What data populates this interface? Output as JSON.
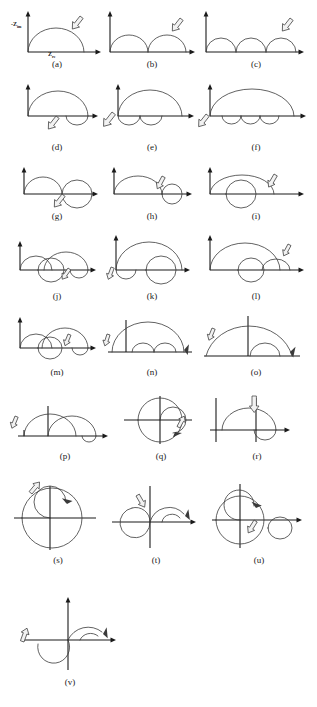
{
  "figure": {
    "axis_labels": {
      "y_main": "-Z",
      "y_sub": "im",
      "x_main": "Z",
      "x_sub": "re"
    },
    "panels": [
      {
        "id": "a",
        "label": "(a)",
        "description": "single depressed semicircle above real axis",
        "x": 10,
        "y": 6,
        "w": 94,
        "h": 50,
        "label_x": 10,
        "label_y": 60,
        "label_w": 94
      },
      {
        "id": "b",
        "label": "(b)",
        "description": "two adjacent semicircles above real axis",
        "x": 104,
        "y": 6,
        "w": 96,
        "h": 50,
        "label_x": 104,
        "label_y": 60,
        "label_w": 96
      },
      {
        "id": "c",
        "label": "(c)",
        "description": "three adjacent semicircles above real axis",
        "x": 200,
        "y": 6,
        "w": 112,
        "h": 50,
        "label_x": 200,
        "label_y": 60,
        "label_w": 112
      },
      {
        "id": "d",
        "label": "(d)",
        "description": "large semicircle above plus one inductive loop below",
        "x": 10,
        "y": 82,
        "w": 94,
        "h": 56,
        "label_x": 10,
        "label_y": 143,
        "label_w": 94
      },
      {
        "id": "e",
        "label": "(e)",
        "description": "large semicircle above plus two inductive loops below",
        "x": 104,
        "y": 82,
        "w": 96,
        "h": 56,
        "label_x": 104,
        "label_y": 143,
        "label_w": 96
      },
      {
        "id": "f",
        "label": "(f)",
        "description": "large semicircle above plus three inductive loops below",
        "x": 200,
        "y": 82,
        "w": 112,
        "h": 56,
        "label_x": 200,
        "label_y": 143,
        "label_w": 112
      },
      {
        "id": "g",
        "label": "(g)",
        "description": "semicircle then larger loop crossing below axis",
        "x": 10,
        "y": 166,
        "w": 94,
        "h": 44,
        "label_x": 10,
        "label_y": 212,
        "label_w": 94
      },
      {
        "id": "h",
        "label": "(h)",
        "description": "semicircle plus small circle straddling axis",
        "x": 104,
        "y": 166,
        "w": 96,
        "h": 44,
        "label_x": 104,
        "label_y": 212,
        "label_w": 96
      },
      {
        "id": "i",
        "label": "(i)",
        "description": "semicircle overlapping a full circle below axis",
        "x": 200,
        "y": 166,
        "w": 112,
        "h": 44,
        "label_x": 200,
        "label_y": 212,
        "label_w": 112
      },
      {
        "id": "j",
        "label": "(j)",
        "description": "small semicircle, overlapping circle and larger loop",
        "x": 10,
        "y": 232,
        "w": 94,
        "h": 56,
        "label_x": 10,
        "label_y": 292,
        "label_w": 94
      },
      {
        "id": "k",
        "label": "(k)",
        "description": "large semicircle with nested circle and small loop",
        "x": 104,
        "y": 232,
        "w": 96,
        "h": 56,
        "label_x": 104,
        "label_y": 292,
        "label_w": 96
      },
      {
        "id": "l",
        "label": "(l)",
        "description": "large semicircle with circle below and small arc right",
        "x": 200,
        "y": 232,
        "w": 112,
        "h": 56,
        "label_x": 200,
        "label_y": 292,
        "label_w": 112
      },
      {
        "id": "m",
        "label": "(m)",
        "description": "semicircle, circle crossing axis and small loop",
        "x": 10,
        "y": 312,
        "w": 94,
        "h": 52,
        "label_x": 10,
        "label_y": 368,
        "label_w": 94
      },
      {
        "id": "n",
        "label": "(n)",
        "description": "large arc with two small semicircles, axis offset right",
        "x": 104,
        "y": 312,
        "w": 96,
        "h": 52,
        "label_x": 104,
        "label_y": 368,
        "label_w": 96
      },
      {
        "id": "o",
        "label": "(o)",
        "description": "large arc crossing vertical axis plus small arc",
        "x": 200,
        "y": 312,
        "w": 112,
        "h": 52,
        "label_x": 200,
        "label_y": 368,
        "label_w": 112
      },
      {
        "id": "p",
        "label": "(p)",
        "description": "two overlapping arcs with vertical line, loop at right",
        "x": 10,
        "y": 392,
        "w": 110,
        "h": 56,
        "label_x": 10,
        "label_y": 452,
        "label_w": 110
      },
      {
        "id": "q",
        "label": "(q)",
        "description": "full circle centred on origin with inner spiral arc",
        "x": 120,
        "y": 392,
        "w": 82,
        "h": 56,
        "label_x": 120,
        "label_y": 452,
        "label_w": 82
      },
      {
        "id": "r",
        "label": "(r)",
        "description": "semicircle crossing vertical axis with loop below",
        "x": 202,
        "y": 392,
        "w": 110,
        "h": 56,
        "label_x": 202,
        "label_y": 452,
        "label_w": 110
      },
      {
        "id": "s",
        "label": "(s)",
        "description": "large circle centred on origin with inner spiral",
        "x": 10,
        "y": 478,
        "w": 96,
        "h": 74,
        "label_x": 10,
        "label_y": 556,
        "label_w": 96
      },
      {
        "id": "t",
        "label": "(t)",
        "description": "S shaped double loop crossing both axes",
        "x": 106,
        "y": 478,
        "w": 100,
        "h": 74,
        "label_x": 106,
        "label_y": 556,
        "label_w": 100
      },
      {
        "id": "u",
        "label": "(u)",
        "description": "large circle with inner spiral plus small circle at right",
        "x": 206,
        "y": 478,
        "w": 106,
        "h": 74,
        "label_x": 206,
        "label_y": 556,
        "label_w": 106
      },
      {
        "id": "v",
        "label": "(v)",
        "description": "S shaped curve with hook crossing vertical axis",
        "x": 10,
        "y": 592,
        "w": 120,
        "h": 82,
        "label_x": 10,
        "label_y": 678,
        "label_w": 120
      }
    ]
  }
}
